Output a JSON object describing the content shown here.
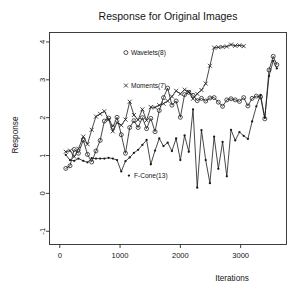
{
  "chart_data": {
    "type": "line",
    "title": "Response for Original Images",
    "xlabel": "Iterations",
    "ylabel": "Response",
    "xlim": [
      -170,
      3760
    ],
    "ylim": [
      -1.35,
      4.25
    ],
    "xticks": [
      0,
      1000,
      2000,
      3000
    ],
    "xticklabels": [
      "0",
      "1000",
      "2000",
      "3000"
    ],
    "yticks": [
      -1,
      0,
      1,
      2,
      3,
      4
    ],
    "yticklabels": [
      "-1",
      "0",
      "1",
      "2",
      "3",
      "4"
    ],
    "grid": false,
    "legend": "inline-annotations",
    "colors": {
      "ink": "#1a1a1a",
      "frame": "#2b2b2b",
      "background": "#ffffff"
    },
    "annotations": [
      {
        "text": "Wavelets(8)",
        "marker": "circle",
        "x": 1180,
        "y": 3.72
      },
      {
        "text": "Moments(7)",
        "marker": "cross",
        "x": 1180,
        "y": 2.85
      },
      {
        "text": "F-Cone(13)",
        "marker": "dot",
        "x": 1230,
        "y": 0.47
      }
    ],
    "series": [
      {
        "name": "Wavelets(8)",
        "marker": "circle",
        "x": [
          100,
          170,
          240,
          310,
          390,
          460,
          530,
          600,
          670,
          740,
          810,
          880,
          950,
          1020,
          1090,
          1160,
          1230,
          1300,
          1370,
          1440,
          1510,
          1580,
          1650,
          1720,
          1790,
          1860,
          1930,
          2000,
          2070,
          2140,
          2210,
          2280,
          2350,
          2420,
          2490,
          2560,
          2630,
          2700,
          2770,
          2840,
          2910,
          2980,
          3050,
          3120,
          3190,
          3260,
          3330,
          3400,
          3470,
          3540,
          3600
        ],
        "values": [
          0.66,
          0.73,
          1.16,
          1.06,
          1.41,
          1.03,
          0.83,
          1.12,
          1.4,
          1.91,
          1.99,
          1.75,
          2.01,
          1.55,
          1.06,
          1.74,
          1.92,
          1.74,
          2.0,
          1.71,
          1.98,
          1.63,
          2.19,
          2.53,
          2.78,
          2.33,
          2.44,
          2.01,
          2.61,
          2.67,
          2.59,
          2.45,
          2.51,
          2.44,
          2.52,
          2.53,
          2.41,
          2.3,
          2.47,
          2.5,
          2.47,
          2.43,
          2.53,
          2.31,
          2.51,
          2.57,
          2.55,
          1.97,
          3.26,
          3.62,
          3.4
        ]
      },
      {
        "name": "Moments(7)",
        "marker": "cross",
        "x": [
          100,
          170,
          240,
          310,
          390,
          460,
          530,
          600,
          670,
          740,
          810,
          880,
          950,
          1020,
          1090,
          1160,
          1230,
          1300,
          1370,
          1440,
          1510,
          1580,
          1650,
          1720,
          1790,
          1860,
          1930,
          2000,
          2070,
          2140,
          2210,
          2280,
          2350,
          2420,
          2490,
          2560,
          2630,
          2700,
          2770,
          2840,
          2910,
          2980,
          3050
        ],
        "values": [
          1.1,
          1.13,
          0.97,
          1.18,
          1.5,
          1.3,
          1.68,
          2.03,
          2.1,
          2.17,
          1.95,
          1.64,
          1.87,
          1.8,
          1.95,
          2.42,
          2.07,
          1.94,
          2.22,
          1.93,
          2.28,
          2.27,
          2.33,
          2.37,
          2.44,
          2.56,
          2.71,
          2.63,
          2.74,
          2.68,
          2.5,
          2.63,
          2.73,
          2.9,
          3.37,
          3.85,
          3.86,
          3.87,
          3.88,
          3.93,
          3.9,
          3.91,
          3.89
        ]
      },
      {
        "name": "F-Cone(13)",
        "marker": "dot",
        "x": [
          100,
          170,
          240,
          310,
          390,
          460,
          530,
          600,
          670,
          740,
          810,
          880,
          950,
          1020,
          1090,
          1160,
          1230,
          1300,
          1370,
          1440,
          1510,
          1580,
          1650,
          1720,
          1790,
          1860,
          1930,
          2000,
          2070,
          2140,
          2210,
          2280,
          2350,
          2420,
          2490,
          2560,
          2630,
          2700,
          2770,
          2840,
          2910,
          2980,
          3050,
          3120,
          3190,
          3260,
          3330,
          3400,
          3470,
          3540,
          3600
        ],
        "values": [
          1.02,
          0.88,
          0.86,
          0.92,
          0.86,
          0.82,
          0.93,
          0.92,
          0.92,
          0.92,
          0.94,
          0.92,
          0.88,
          0.58,
          0.85,
          0.95,
          1.07,
          1.15,
          1.28,
          1.41,
          0.77,
          1.13,
          1.45,
          1.25,
          1.34,
          1.12,
          1.45,
          0.88,
          1.53,
          1.1,
          2.22,
          0.15,
          1.67,
          0.88,
          0.27,
          1.5,
          0.65,
          1.36,
          0.45,
          1.68,
          1.4,
          1.62,
          1.52,
          1.44,
          1.9,
          2.3,
          2.6,
          2.0,
          3.1,
          3.5,
          3.3
        ]
      }
    ]
  }
}
